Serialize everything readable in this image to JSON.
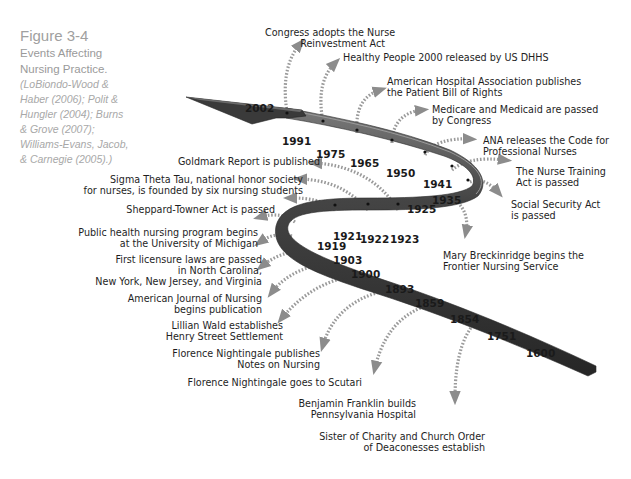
{
  "caption": {
    "figure": "Figure 3-4",
    "title_line1": "Events Affecting",
    "title_line2": "Nursing Practice.",
    "refs": [
      "(LoBiondo-Wood &",
      "Haber (2006); Polit &",
      "Hungler (2004); Burns",
      "& Grove (2007);",
      "Williams-Evans, Jacob,",
      "& Carnegie (2005).)"
    ]
  },
  "colors": {
    "ribbon": "#3a3a3a",
    "ribbon_highlight": "#8a8a8a",
    "dotted_arrow": "#9c9c9c",
    "text": "#1e1e1e",
    "caption": "#9a9a9a"
  },
  "years": {
    "y2002": "2002",
    "y1991": "1991",
    "y1975": "1975",
    "y1965": "1965",
    "y1950": "1950",
    "y1941": "1941",
    "y1935": "1935",
    "y1925": "1925",
    "y1923": "1923",
    "y1922": "1922",
    "y1921": "1921",
    "y1919": "1919",
    "y1903": "1903",
    "y1900": "1900",
    "y1893": "1893",
    "y1859": "1859",
    "y1854": "1854",
    "y1751": "1751",
    "y1600": "1600"
  },
  "events": {
    "e2002": [
      "Congress adopts the Nurse",
      "Reinvestment Act"
    ],
    "e1991": [
      "Healthy People 2000 released by US DHHS"
    ],
    "e1975": [
      "American Hospital Association publishes",
      "the Patient Bill of Rights"
    ],
    "e1965": [
      "Medicare and Medicaid are passed",
      "by Congress"
    ],
    "e1950": [
      "ANA releases the Code for",
      "Professional Nurses"
    ],
    "e1941": [
      "The Nurse Training",
      "Act is passed"
    ],
    "e1935": [
      "Social Security Act",
      "is passed"
    ],
    "e1925": [
      "Mary Breckinridge begins the",
      "Frontier Nursing Service"
    ],
    "e1923": [
      "Goldmark Report is published"
    ],
    "e1922": [
      "Sigma Theta Tau, national honor society",
      "for nurses, is founded by six nursing students"
    ],
    "e1921": [
      "Sheppard-Towner Act is passed"
    ],
    "e1919": [
      "Public health nursing program begins",
      "at the University of Michigan"
    ],
    "e1903": [
      "First licensure laws are passed",
      "in North Carolina,",
      "New York, New Jersey, and Virginia"
    ],
    "e1900": [
      "American Journal of Nursing",
      "begins publication"
    ],
    "e1893": [
      "Lillian Wald establishes",
      "Henry Street Settlement"
    ],
    "e1859": [
      "Florence Nightingale publishes",
      "Notes on Nursing"
    ],
    "e1854": [
      "Florence Nightingale goes to Scutari"
    ],
    "e1751": [
      "Benjamin Franklin builds",
      "Pennsylvania Hospital"
    ],
    "e1600": [
      "Sister of Charity and Church Order",
      "of Deaconesses establish"
    ]
  }
}
